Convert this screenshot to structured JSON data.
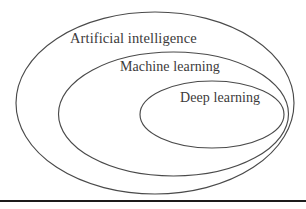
{
  "figure": {
    "type": "nested-set-diagram",
    "background_color": "#ffffff",
    "stroke_color": "#4a4a4a",
    "text_color": "#3c3a3a",
    "rule_color": "#1c1c1c",
    "sets": [
      {
        "id": "artificial-intelligence",
        "label": "Artificial intelligence",
        "level": 1,
        "cx": 155,
        "cy": 103,
        "rx": 139,
        "ry": 91
      },
      {
        "id": "machine-learning",
        "label": "Machine learning",
        "level": 2,
        "cx": 173.5,
        "cy": 114,
        "rx": 115,
        "ry": 62
      },
      {
        "id": "deep-learning",
        "label": "Deep learning",
        "level": 3,
        "cx": 212,
        "cy": 114.5,
        "rx": 72,
        "ry": 33.5
      }
    ]
  }
}
